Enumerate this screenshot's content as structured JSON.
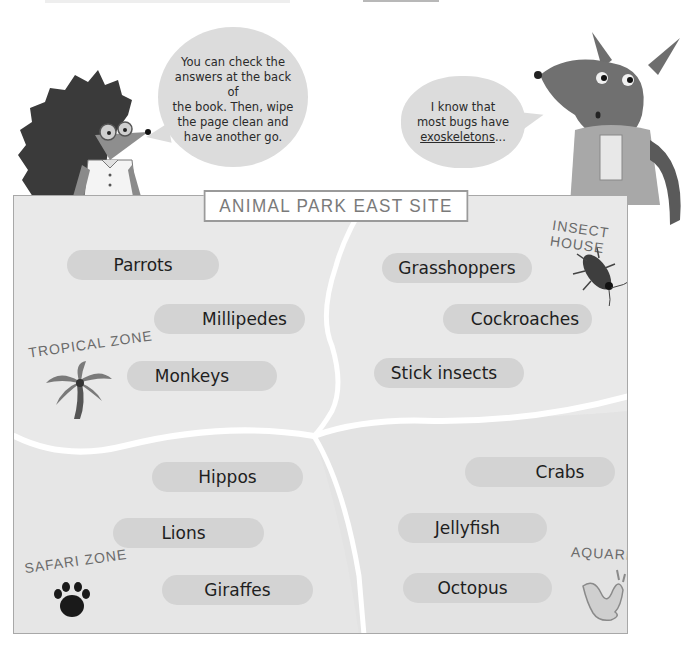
{
  "speech_bubbles": {
    "hedgehog": {
      "lines": [
        "You can check the",
        "answers at the back of",
        "the book. Then, wipe",
        "the page clean and",
        "have another go."
      ]
    },
    "kangaroo": {
      "line1": "I know that",
      "line2": "most bugs have",
      "line3_underlined": "exoskeletons",
      "line3_suffix": "..."
    }
  },
  "map": {
    "title": "ANIMAL PARK EAST SITE",
    "zones": {
      "tropical": {
        "label": "TROPICAL ZONE",
        "icon": "palm-tree-icon",
        "animals": [
          "Parrots",
          "Millipedes",
          "Monkeys"
        ]
      },
      "insect": {
        "label": "INSECT HOUSE",
        "icon": "cockroach-icon",
        "animals": [
          "Grasshoppers",
          "Cockroaches",
          "Stick insects"
        ]
      },
      "safari": {
        "label": "SAFARI ZONE",
        "icon": "paw-print-icon",
        "animals": [
          "Hippos",
          "Lions",
          "Giraffes"
        ]
      },
      "aquarium": {
        "label": "AQUARIUM",
        "icon": "water-splash-icon",
        "animals": [
          "Crabs",
          "Jellyfish",
          "Octopus"
        ]
      }
    }
  },
  "colors": {
    "map_background": "#e6e6e6",
    "pill": "#d3d3d3",
    "bubble": "#dcdcdc",
    "roads": "#ffffff",
    "border": "#a8a8a8"
  }
}
